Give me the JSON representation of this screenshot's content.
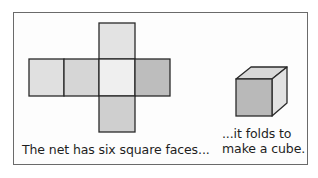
{
  "figure": {
    "net": {
      "faces": [
        {
          "id": "top",
          "x": 99,
          "y": 23,
          "w": 36,
          "h": 36,
          "fill": "#e3e3e3"
        },
        {
          "id": "left",
          "x": 29,
          "y": 59,
          "w": 35,
          "h": 37,
          "fill": "#e0e0e0"
        },
        {
          "id": "middle-left",
          "x": 64,
          "y": 59,
          "w": 35,
          "h": 37,
          "fill": "#d6d6d6"
        },
        {
          "id": "center",
          "x": 99,
          "y": 59,
          "w": 36,
          "h": 37,
          "fill": "#efefef"
        },
        {
          "id": "right",
          "x": 135,
          "y": 59,
          "w": 35,
          "h": 37,
          "fill": "#bdbdbd"
        },
        {
          "id": "bottom",
          "x": 99,
          "y": 96,
          "w": 36,
          "h": 36,
          "fill": "#cfcfcf"
        }
      ],
      "stroke": "#2a2a2a"
    },
    "cube": {
      "front_fill": "#b9b9b9",
      "top_fill": "#d8d8d8",
      "side_fill": "#e2e2e2",
      "stroke": "#2a2a2a"
    },
    "caption_left": "The net has six square faces...",
    "caption_right_line1": "...it folds to",
    "caption_right_line2": "make a cube."
  }
}
